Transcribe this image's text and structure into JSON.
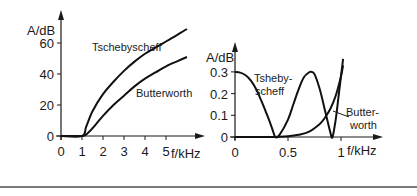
{
  "chart_data": [
    {
      "type": "line",
      "title": "",
      "xlabel": "f/kHz",
      "ylabel": "A/dB",
      "xlim": [
        0,
        6
      ],
      "ylim": [
        0,
        70
      ],
      "xticks": [
        "0",
        "1",
        "2",
        "3",
        "4",
        "5"
      ],
      "yticks": [
        "0",
        "20",
        "40",
        "60"
      ],
      "grid": false,
      "series": [
        {
          "name": "Tschebyscheff",
          "x": [
            0,
            1,
            1.2,
            1.5,
            2,
            2.5,
            3,
            3.5,
            4,
            4.5,
            5,
            5.5,
            6
          ],
          "y": [
            0,
            0,
            6,
            16,
            27,
            35,
            42,
            48,
            53,
            57,
            61,
            65,
            69
          ]
        },
        {
          "name": "Butterworth",
          "x": [
            0,
            1,
            1.2,
            1.5,
            2,
            2.5,
            3,
            3.5,
            4,
            4.5,
            5,
            5.5,
            6
          ],
          "y": [
            0,
            0,
            1,
            5,
            13,
            20,
            26,
            32,
            37,
            41,
            45,
            48,
            51
          ]
        }
      ],
      "annotations": [
        {
          "text": "Tschebyscheff",
          "x": 2.2,
          "y": 62
        },
        {
          "text": "Butterworth",
          "x": 3.5,
          "y": 26
        }
      ]
    },
    {
      "type": "line",
      "title": "",
      "xlabel": "f/kHz",
      "ylabel": "A/dB",
      "xlim": [
        0,
        1.05
      ],
      "ylim": [
        0,
        0.36
      ],
      "xticks": [
        "0",
        "0.5",
        "1"
      ],
      "yticks": [
        "0",
        "0.1",
        "0.2",
        "0.3"
      ],
      "grid": false,
      "series": [
        {
          "name": "Tsheby-scheff",
          "x": [
            0,
            0.05,
            0.1,
            0.15,
            0.2,
            0.25,
            0.3,
            0.35,
            0.38,
            0.42,
            0.5,
            0.55,
            0.6,
            0.65,
            0.7,
            0.72,
            0.75,
            0.8,
            0.85,
            0.9,
            0.92,
            0.95,
            0.98,
            1.02
          ],
          "y": [
            0.3,
            0.297,
            0.285,
            0.26,
            0.22,
            0.165,
            0.105,
            0.04,
            0.0,
            0.01,
            0.08,
            0.15,
            0.22,
            0.275,
            0.298,
            0.3,
            0.29,
            0.22,
            0.12,
            0.02,
            0.0,
            0.08,
            0.2,
            0.36
          ]
        },
        {
          "name": "Butter-worth",
          "x": [
            0,
            0.3,
            0.4,
            0.5,
            0.6,
            0.7,
            0.8,
            0.85,
            0.9,
            0.95,
            1.0,
            1.02
          ],
          "y": [
            0,
            0,
            0.001,
            0.003,
            0.01,
            0.025,
            0.06,
            0.09,
            0.13,
            0.19,
            0.28,
            0.33
          ]
        }
      ],
      "annotations": [
        {
          "text": "Tsheby-",
          "x": 0.18,
          "y": 0.27
        },
        {
          "text": "scheff",
          "x": 0.18,
          "y": 0.22
        },
        {
          "text": "Butter-",
          "x": 1.03,
          "y": 0.1
        },
        {
          "text": "worth",
          "x": 1.03,
          "y": 0.05
        }
      ]
    }
  ],
  "labels": {
    "left": {
      "ylabel": "A/dB",
      "xlabel": "f/kHz",
      "series_a": "Tschebyscheff",
      "series_b": "Butterworth"
    },
    "right": {
      "ylabel": "A/dB",
      "xlabel": "f/kHz",
      "series_a_1": "Tsheby-",
      "series_a_2": "scheff",
      "series_b_1": "Butter-",
      "series_b_2": "worth"
    }
  }
}
